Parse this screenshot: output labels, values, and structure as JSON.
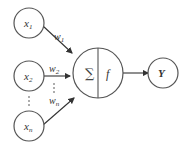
{
  "diagram": {
    "type": "perceptron",
    "inputs": [
      {
        "label": "x",
        "sub": "1"
      },
      {
        "label": "x",
        "sub": "2"
      },
      {
        "label": "x",
        "sub": "n"
      }
    ],
    "weights": [
      {
        "label": "w",
        "sub": "1"
      },
      {
        "label": "w",
        "sub": "2"
      },
      {
        "label": "w",
        "sub": "n"
      }
    ],
    "neuron": {
      "sum_symbol": "∑",
      "activation": "f"
    },
    "output": {
      "label": "Y"
    },
    "ellipsis_vertical": "⋮",
    "colors": {
      "stroke": "#555555",
      "text": "#333333",
      "background": "#ffffff"
    }
  }
}
